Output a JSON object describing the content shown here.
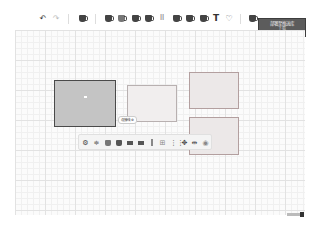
{
  "toolbar": {
    "undo_icon": "↶",
    "redo_icon": "↷",
    "text_tool_label": "T",
    "icons": [
      "undo-icon",
      "redo-icon",
      "shape-icon",
      "rect-icon",
      "ellipse-icon",
      "diamond-icon",
      "triangle-icon",
      "grid-icon",
      "cylinder-icon",
      "cube-icon",
      "document-icon",
      "text-icon",
      "sticky-note-icon",
      "layers-icon"
    ],
    "grid_glyph": "⠿",
    "sticky_glyph": "♡",
    "deploy_button": {
      "line1": "部署至推送库",
      "line2": "下载",
      "bg_color": "#5c5c5c"
    }
  },
  "canvas": {
    "shapes": [
      {
        "id": "rect-a",
        "state": "selected",
        "fill": "#c4c4c4",
        "border": "#4a4a4a"
      },
      {
        "id": "rect-b",
        "state": "normal",
        "fill": "#f1eeee",
        "border": "#b8b0b0"
      },
      {
        "id": "rect-c",
        "state": "normal",
        "fill": "#ece8e8",
        "border": "#b39f9f"
      },
      {
        "id": "rect-d",
        "state": "normal",
        "fill": "#ece8e8",
        "border": "#b39f9f"
      }
    ],
    "float_label": {
      "text": "连接线",
      "icon": "⊕"
    }
  },
  "float_toolbar": {
    "glyphs": {
      "settings": "⚙",
      "align": "≑",
      "arrange": "⊞",
      "group": "⧉",
      "distribute": "⋮⋮",
      "more": "✥",
      "split": "⇹",
      "view": "◉"
    }
  },
  "zoom_control": {
    "label": "zoom-slider"
  }
}
